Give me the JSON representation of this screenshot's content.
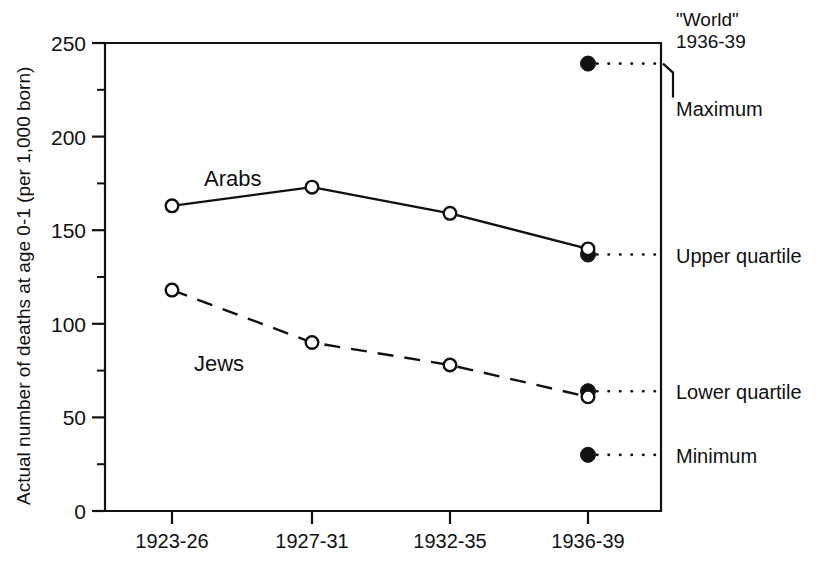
{
  "chart_data": {
    "type": "line",
    "title": "",
    "xlabel": "",
    "ylabel": "Actual number of deaths at age 0-1 (per 1,000 born)",
    "categories": [
      "1923-26",
      "1927-31",
      "1932-35",
      "1936-39"
    ],
    "ylim": [
      0,
      250
    ],
    "yticks": [
      0,
      50,
      100,
      150,
      200,
      250
    ],
    "ytick_labels": [
      "0",
      "50",
      "100",
      "150",
      "200",
      "250"
    ],
    "yminor_ticks": [
      25,
      75,
      125,
      175,
      225
    ],
    "grid": false,
    "legend_position": "inline-annotations",
    "series": [
      {
        "name": "Arabs",
        "values": [
          163,
          173,
          159,
          140
        ],
        "line_style": "solid",
        "marker": "open-circle"
      },
      {
        "name": "Jews",
        "values": [
          118,
          90,
          78,
          61
        ],
        "line_style": "dashed",
        "marker": "open-circle"
      }
    ],
    "reference_group": {
      "title_line1": "\"World\"",
      "title_line2": "1936-39",
      "at_category": "1936-39",
      "marker": "filled-circle",
      "connector": "dotted",
      "points": [
        {
          "label": "Maximum",
          "value": 239
        },
        {
          "label": "Upper quartile",
          "value": 137
        },
        {
          "label": "Lower quartile",
          "value": 64
        },
        {
          "label": "Minimum",
          "value": 30
        }
      ]
    }
  },
  "colors": {
    "ink": "#111111",
    "background": "#ffffff"
  }
}
